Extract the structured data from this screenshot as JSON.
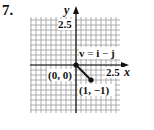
{
  "problem": {
    "number": "7."
  },
  "chart_data": {
    "type": "vector-plot",
    "title": "",
    "xlabel": "x",
    "ylabel": "y",
    "x_tick_label": "2.5",
    "y_tick_label": "2.5",
    "grid": true,
    "grid_step": 0.3333,
    "xlim": [
      -3.07,
      2.93
    ],
    "ylim": [
      -3.2,
      3.2
    ],
    "vectors": [
      {
        "name": "v",
        "label": "v = i − j",
        "tail": [
          0,
          0
        ],
        "head": [
          1,
          -1
        ],
        "tail_label": "(0, 0)",
        "head_label": "(1, −1)"
      }
    ]
  },
  "labels": {
    "y_axis": "y",
    "x_axis": "x",
    "y_tick": "2.5",
    "x_tick": "2.5",
    "vector_eq_v": "v",
    "vector_eq_eq": " = ",
    "vector_eq_i": "i",
    "vector_eq_minus": " − ",
    "vector_eq_j": "j",
    "origin": "(0, 0)",
    "endpoint": "(1, −1)"
  },
  "colors": {
    "grid": "#9a9a9a",
    "axis": "#111111",
    "vector": "#111111"
  }
}
